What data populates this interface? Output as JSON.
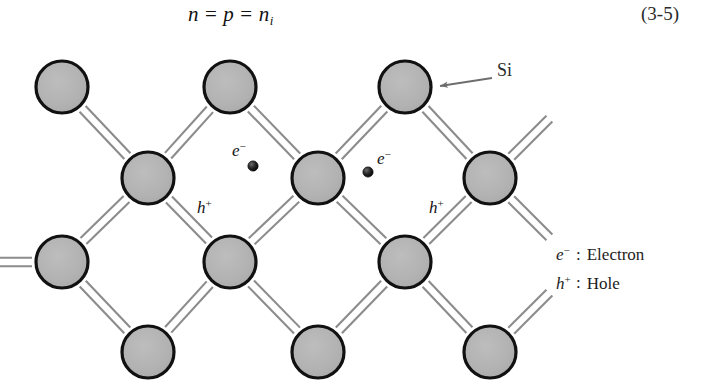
{
  "equation": {
    "left": "n",
    "operator1": "=",
    "middle": "p",
    "operator2": "=",
    "right_base": "n",
    "right_sub": "i",
    "full_text": "n = p = n_i",
    "number": "(3-5)"
  },
  "figure": {
    "type": "semiconductor-lattice-diagram",
    "material": "Silicon",
    "atom_label": "Si",
    "atom_fill_color": "#b3b3b3",
    "atom_outline_color": "#111111",
    "bond_color": "#8c8c8c",
    "background_color": "#ffffff",
    "carrier_dot_color": "#1a1a1a",
    "atom_radius": 26,
    "atom_rows": [
      {
        "y": 87,
        "x": [
          62,
          230,
          405
        ]
      },
      {
        "y": 178,
        "x": [
          148,
          318,
          490
        ]
      },
      {
        "y": 262,
        "x": [
          62,
          230,
          405
        ]
      },
      {
        "y": 352,
        "x": [
          148,
          318,
          490
        ]
      }
    ],
    "callout": {
      "label": "Si",
      "label_x": 497,
      "label_y": 68,
      "arrow_tail_x": 492,
      "arrow_tail_y": 78,
      "arrow_head_x": 440,
      "arrow_head_y": 86
    },
    "carriers": [
      {
        "kind": "electron",
        "symbol_base": "e",
        "symbol_sup": "−",
        "label_x": 232,
        "label_y": 156,
        "dot_x": 253,
        "dot_y": 166,
        "dot_side": "right-below"
      },
      {
        "kind": "electron",
        "symbol_base": "e",
        "symbol_sup": "−",
        "label_x": 377,
        "label_y": 164,
        "dot_x": 368,
        "dot_y": 172,
        "dot_side": "left"
      },
      {
        "kind": "hole",
        "symbol_base": "h",
        "symbol_sup": "+",
        "label_x": 197,
        "label_y": 213,
        "dot_x": null,
        "dot_y": null,
        "dot_side": "none"
      },
      {
        "kind": "hole",
        "symbol_base": "h",
        "symbol_sup": "+",
        "label_x": 429,
        "label_y": 213,
        "dot_x": null,
        "dot_y": null,
        "dot_side": "none"
      }
    ]
  },
  "legend": {
    "items": [
      {
        "symbol": "e",
        "superscript": "−",
        "separator": ":",
        "name": "Electron"
      },
      {
        "symbol": "h",
        "superscript": "+",
        "separator": ":",
        "name": "Hole"
      }
    ]
  }
}
